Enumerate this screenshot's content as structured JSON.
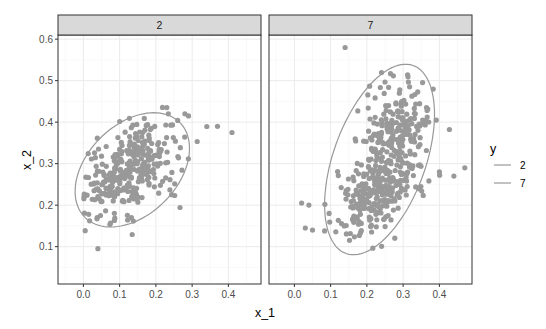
{
  "chart_data": {
    "type": "scatter",
    "layout": "faceted",
    "facet_variable": "y",
    "xlabel": "x_1",
    "ylabel": "x_2",
    "xlim": [
      -0.07,
      0.49
    ],
    "ylim": [
      0.01,
      0.61
    ],
    "x_ticks": [
      0.0,
      0.1,
      0.2,
      0.3,
      0.4
    ],
    "x_tick_labels": [
      "0.0",
      "0.1",
      "0.2",
      "0.3",
      "0.4"
    ],
    "y_ticks": [
      0.1,
      0.2,
      0.3,
      0.4,
      0.5,
      0.6
    ],
    "y_tick_labels": [
      "0.1",
      "0.2",
      "0.3",
      "0.4",
      "0.5",
      "0.6"
    ],
    "grid": true,
    "legend": {
      "title": "y",
      "position": "right",
      "entries": [
        {
          "label": "2",
          "color": "#999999"
        },
        {
          "label": "7",
          "color": "#999999"
        }
      ]
    },
    "colors": {
      "points": "#999999",
      "ellipse": "#999999",
      "strip_fill": "#d9d9d9",
      "strip_border": "#333333",
      "panel_border": "#333333",
      "grid_major": "#ebebeb",
      "grid_minor": "#f5f5f5"
    },
    "panels": [
      {
        "label": "2",
        "n_points": 340,
        "clusters": [
          {
            "weight": 1.0,
            "mean": [
              0.13,
              0.285
            ],
            "sd": [
              0.065,
              0.055
            ],
            "corr": 0.45
          }
        ],
        "outliers": [
          [
            0.04,
            0.095
          ],
          [
            0.37,
            0.39
          ],
          [
            0.41,
            0.375
          ],
          [
            0.23,
            0.435
          ],
          [
            0.28,
            0.42
          ],
          [
            0.29,
            0.415
          ]
        ],
        "ellipse": {
          "center": [
            0.135,
            0.285
          ],
          "semi_major": 0.175,
          "semi_minor": 0.115,
          "angle_deg": 35
        },
        "seed": 7
      },
      {
        "label": "7",
        "n_points": 460,
        "clusters": [
          {
            "weight": 0.55,
            "mean": [
              0.215,
              0.225
            ],
            "sd": [
              0.055,
              0.05
            ],
            "corr": 0.35
          },
          {
            "weight": 0.45,
            "mean": [
              0.285,
              0.385
            ],
            "sd": [
              0.045,
              0.055
            ],
            "corr": 0.1
          }
        ],
        "outliers": [
          [
            0.14,
            0.58
          ],
          [
            0.02,
            0.205
          ],
          [
            0.04,
            0.2
          ],
          [
            0.47,
            0.29
          ],
          [
            0.44,
            0.27
          ],
          [
            0.4,
            0.28
          ],
          [
            0.03,
            0.145
          ],
          [
            0.05,
            0.14
          ]
        ],
        "ellipse": {
          "center": [
            0.235,
            0.31
          ],
          "semi_major": 0.245,
          "semi_minor": 0.125,
          "angle_deg": 66
        },
        "seed": 19
      }
    ]
  }
}
